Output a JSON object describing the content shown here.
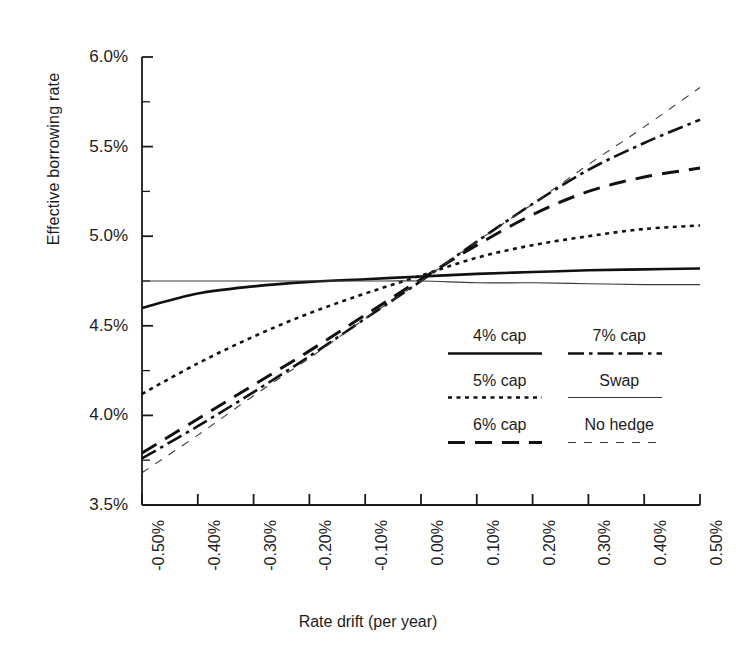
{
  "chart_data": {
    "type": "line",
    "title": "",
    "xlabel": "Rate drift (per year)",
    "ylabel": "Effective borrowing rate",
    "xlim": [
      -0.5,
      0.5
    ],
    "ylim": [
      3.5,
      6.0
    ],
    "grid": false,
    "legend_position": "inside-lower-right",
    "x_tick_labels": [
      "-0.50%",
      "-0.40%",
      "-0.30%",
      "-0.20%",
      "-0.10%",
      "0.00%",
      "0.10%",
      "0.20%",
      "0.30%",
      "0.40%",
      "0.50%"
    ],
    "x_tick_values": [
      -0.5,
      -0.4,
      -0.3,
      -0.2,
      -0.1,
      0.0,
      0.1,
      0.2,
      0.3,
      0.4,
      0.5
    ],
    "y_tick_labels": [
      "6.0%",
      "5.5%",
      "5.0%",
      "4.5%",
      "4.0%",
      "3.5%"
    ],
    "y_tick_values": [
      6.0,
      5.5,
      5.0,
      4.5,
      4.0,
      3.5
    ],
    "y_minor_tick_values": [
      5.75,
      5.25,
      4.75,
      4.25,
      3.75
    ],
    "x": [
      -0.5,
      -0.4,
      -0.3,
      -0.2,
      -0.1,
      0.0,
      0.1,
      0.2,
      0.3,
      0.4,
      0.5
    ],
    "series": [
      {
        "name": "4% cap",
        "style": "solid",
        "width": 2.6,
        "color": "#111111",
        "values": [
          4.6,
          4.68,
          4.72,
          4.745,
          4.76,
          4.775,
          4.79,
          4.8,
          4.81,
          4.815,
          4.82
        ]
      },
      {
        "name": "5% cap",
        "style": "dotted",
        "width": 2.6,
        "color": "#111111",
        "values": [
          4.12,
          4.29,
          4.44,
          4.57,
          4.68,
          4.78,
          4.88,
          4.95,
          5.0,
          5.04,
          5.06
        ]
      },
      {
        "name": "6% cap",
        "style": "long-dash",
        "width": 3.0,
        "color": "#111111",
        "values": [
          3.79,
          3.98,
          4.17,
          4.36,
          4.56,
          4.76,
          4.95,
          5.12,
          5.25,
          5.33,
          5.38
        ]
      },
      {
        "name": "7% cap",
        "style": "dash-dot",
        "width": 2.6,
        "color": "#111111",
        "values": [
          3.76,
          3.94,
          4.13,
          4.33,
          4.54,
          4.75,
          4.97,
          5.18,
          5.37,
          5.52,
          5.65
        ]
      },
      {
        "name": "Swap",
        "style": "thin-solid",
        "width": 1.1,
        "color": "#3a3a3a",
        "values": [
          4.75,
          4.75,
          4.75,
          4.75,
          4.75,
          4.75,
          4.74,
          4.74,
          4.735,
          4.73,
          4.73
        ]
      },
      {
        "name": "No hedge",
        "style": "thin-dash",
        "width": 1.1,
        "color": "#3a3a3a",
        "values": [
          3.68,
          3.89,
          4.11,
          4.32,
          4.54,
          4.75,
          4.97,
          5.18,
          5.4,
          5.61,
          5.83
        ]
      }
    ]
  },
  "legend": {
    "items": [
      {
        "label": "4% cap",
        "style": "solid"
      },
      {
        "label": "7% cap",
        "style": "dash-dot"
      },
      {
        "label": "5% cap",
        "style": "dotted"
      },
      {
        "label": "Swap",
        "style": "thin-solid"
      },
      {
        "label": "6% cap",
        "style": "long-dash"
      },
      {
        "label": "No hedge",
        "style": "thin-dash"
      }
    ]
  },
  "axis": {
    "y_label": "Effective borrowing rate",
    "x_label": "Rate drift (per year)"
  }
}
